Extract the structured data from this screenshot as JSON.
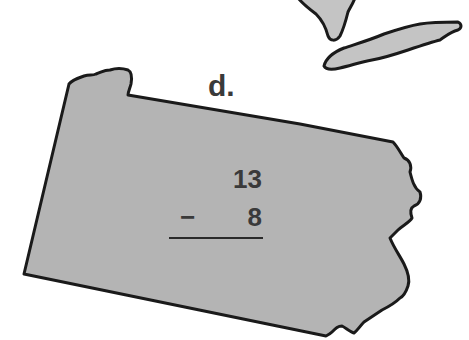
{
  "worksheet": {
    "problem_label": "d.",
    "problem": {
      "top_number": "13",
      "operator": "−",
      "bottom_number": "8",
      "operation": "subtraction"
    }
  },
  "map": {
    "shapes": [
      "pennsylvania-state-outline",
      "lake-erie",
      "lake-huron-tip"
    ],
    "fill_color": "#b4b4b4",
    "outline_color": "#1a1a1a",
    "background_color": "#ffffff"
  }
}
